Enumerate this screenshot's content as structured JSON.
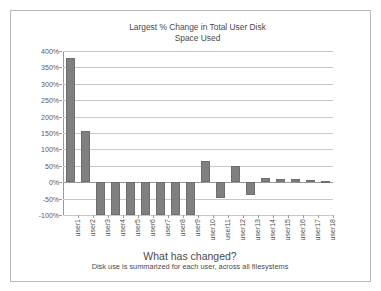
{
  "slide": {
    "footer_heading": "What has changed?",
    "footer_subtext": "Disk use is summarized for each user, across all filesystems"
  },
  "colors": {
    "bar_fill": "#808080",
    "bar_stroke": "#6e6e6e",
    "gridline": "#c8c8c8",
    "axis": "#9a9a9a",
    "frame": "#b9b9b9",
    "text": "#4a4a4a"
  },
  "chart_data": {
    "type": "bar",
    "title": "Largest % Change in Total User Disk\nSpace Used",
    "xlabel": "",
    "ylabel": "",
    "ylim": [
      -100,
      400
    ],
    "ytick_labels": [
      "400%",
      "350%",
      "300%",
      "250%",
      "200%",
      "150%",
      "100%",
      "50%",
      "0%",
      "-50%",
      "-100%"
    ],
    "ytick_values": [
      400,
      350,
      300,
      250,
      200,
      150,
      100,
      50,
      0,
      -50,
      -100
    ],
    "grid": true,
    "legend": false,
    "categories": [
      "user1",
      "user2",
      "user3",
      "user4",
      "user5",
      "user6",
      "user7",
      "user8",
      "user9",
      "user10",
      "user11",
      "user12",
      "user13",
      "user14",
      "user15",
      "user16",
      "user17",
      "user18"
    ],
    "values": [
      380,
      157,
      -100,
      -100,
      -100,
      -100,
      -100,
      -100,
      -100,
      65,
      -48,
      48,
      -38,
      12,
      11,
      9,
      6,
      5
    ]
  }
}
